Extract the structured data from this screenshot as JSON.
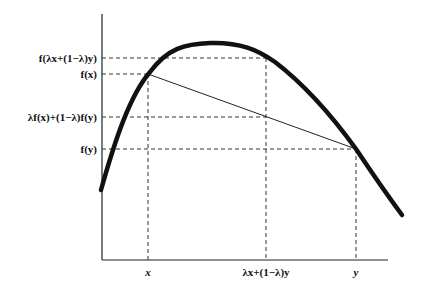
{
  "y_labels": {
    "f_mix": "f(λx+(1−λ)y)",
    "f_x": "f(x)",
    "chord": "λf(x)+(1−λ)f(y)",
    "f_y": "f(y)"
  },
  "x_labels": {
    "x": "x",
    "mix": "λx+(1−λ)y",
    "y": "y"
  },
  "colors": {
    "curve": "#111111",
    "axis": "#222222",
    "dashed": "#333333"
  }
}
